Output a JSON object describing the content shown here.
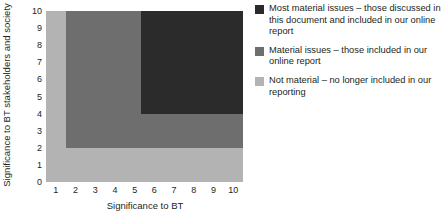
{
  "chart_data": {
    "type": "heatmap",
    "title": "",
    "xlabel": "Significance to BT",
    "ylabel": "Significance to BT stakeholders and society",
    "xlim": [
      0.5,
      10.5
    ],
    "ylim": [
      0,
      10
    ],
    "xticks": [
      "1",
      "2",
      "3",
      "4",
      "5",
      "6",
      "7",
      "8",
      "9",
      "10"
    ],
    "yticks": [
      "0",
      "1",
      "2",
      "3",
      "4",
      "5",
      "6",
      "7",
      "8",
      "9",
      "10"
    ],
    "grid": false,
    "legend_position": "right",
    "regions": [
      {
        "name": "not-material",
        "label": "Not material",
        "color": "#b3b3b3",
        "x_start": 0.5,
        "x_end": 10.5,
        "y_start": 0,
        "y_end": 10
      },
      {
        "name": "material-issues",
        "label": "Material issues",
        "color": "#6e6e6e",
        "x_start": 1.5,
        "x_end": 10.5,
        "y_start": 2,
        "y_end": 10
      },
      {
        "name": "most-material-issues",
        "label": "Most material issues",
        "color": "#2b2b2b",
        "x_start": 5.3,
        "x_end": 10.5,
        "y_start": 4,
        "y_end": 10
      }
    ],
    "legend": [
      {
        "color": "#2b2b2b",
        "text": "Most material issues – those discussed in this document and included in our online report"
      },
      {
        "color": "#6e6e6e",
        "text": "Material issues – those included in our online report"
      },
      {
        "color": "#b3b3b3",
        "text": "Not material – no longer included in our reporting"
      }
    ]
  }
}
